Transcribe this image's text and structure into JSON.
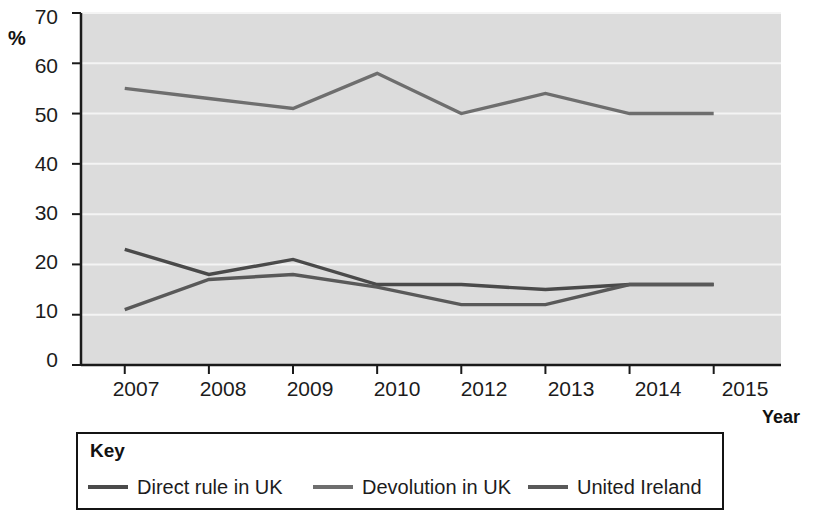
{
  "chart_data": {
    "type": "line",
    "title": "",
    "xlabel": "Year",
    "ylabel": "%",
    "categories": [
      "2007",
      "2008",
      "2009",
      "2010",
      "2012",
      "2013",
      "2014",
      "2015"
    ],
    "ylim": [
      0,
      70
    ],
    "yticks": [
      0,
      10,
      20,
      30,
      40,
      50,
      60,
      70
    ],
    "grid": "horizontal",
    "legend_position": "bottom",
    "legend_title": "Key",
    "series": [
      {
        "name": "Direct rule in UK",
        "color": "#4a4a4a",
        "values": [
          23,
          18,
          21,
          16,
          16,
          15,
          16,
          16
        ]
      },
      {
        "name": "Devolution in UK",
        "color": "#6e6e6e",
        "values": [
          55,
          53,
          51,
          58,
          50,
          54,
          50,
          50
        ]
      },
      {
        "name": "United Ireland",
        "color": "#595959",
        "values": [
          11,
          17,
          18,
          15.5,
          12,
          12,
          16,
          16
        ]
      }
    ]
  },
  "axis": {
    "y_title": "%",
    "x_title": "Year",
    "y_tick_labels": [
      "70",
      "60",
      "50",
      "40",
      "30",
      "20",
      "10",
      "0"
    ],
    "x_tick_labels": [
      "2007",
      "2008",
      "2009",
      "2010",
      "2012",
      "2013",
      "2014",
      "2015"
    ]
  },
  "legend": {
    "title": "Key",
    "items": [
      {
        "label": "Direct rule in UK",
        "color": "#4a4a4a"
      },
      {
        "label": "Devolution in UK",
        "color": "#6e6e6e"
      },
      {
        "label": "United Ireland",
        "color": "#595959"
      }
    ]
  },
  "style": {
    "plot_background": "#dcdcdc",
    "gridline_color": "#f4f4f4",
    "axis_color": "#1a1a1a"
  }
}
